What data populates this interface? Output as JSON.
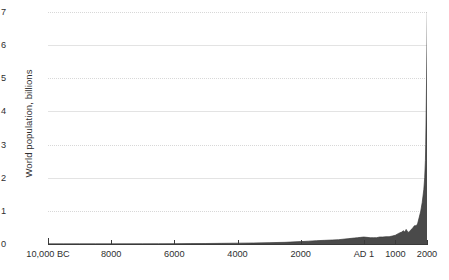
{
  "chart_data": {
    "type": "area",
    "title": "",
    "xlabel": "",
    "ylabel": "World population, billions",
    "ylim": [
      0,
      7
    ],
    "xlim": [
      -10000,
      2000
    ],
    "grid": true,
    "legend": "none",
    "fill_color": "#4a4a4a",
    "line_color": "#3a3a3a",
    "axis_color": "#3a3a3a",
    "gridline_color_solid": "#e3e3e3",
    "gridline_color_dotted": "#d8d8d8",
    "y_ticks": [
      {
        "value": 7,
        "label": "7"
      },
      {
        "value": 6,
        "label": "6"
      },
      {
        "value": 5,
        "label": "5"
      },
      {
        "value": 4,
        "label": "4"
      },
      {
        "value": 3,
        "label": "3"
      },
      {
        "value": 2,
        "label": "2"
      },
      {
        "value": 1,
        "label": "1"
      },
      {
        "value": 0,
        "label": "0"
      }
    ],
    "x_ticks": [
      {
        "value": -10000,
        "label": "10,000 BC"
      },
      {
        "value": -8000,
        "label": "8000"
      },
      {
        "value": -6000,
        "label": "6000"
      },
      {
        "value": -4000,
        "label": "4000"
      },
      {
        "value": -2000,
        "label": "2000"
      },
      {
        "value": 1,
        "label": "AD 1"
      },
      {
        "value": 1000,
        "label": "1000"
      },
      {
        "value": 2000,
        "label": "2000"
      }
    ],
    "x": [
      -10000,
      -9500,
      -9000,
      -8500,
      -8000,
      -7500,
      -7000,
      -6500,
      -6000,
      -5500,
      -5000,
      -4500,
      -4000,
      -3500,
      -3000,
      -2500,
      -2000,
      -1750,
      -1500,
      -1250,
      -1000,
      -800,
      -600,
      -500,
      -400,
      -300,
      -200,
      -100,
      1,
      100,
      200,
      300,
      400,
      500,
      600,
      700,
      800,
      900,
      1000,
      1100,
      1200,
      1250,
      1300,
      1340,
      1400,
      1450,
      1500,
      1550,
      1600,
      1650,
      1700,
      1750,
      1800,
      1850,
      1900,
      1927,
      1950,
      1960,
      1974,
      1987,
      1999,
      2011
    ],
    "y": [
      0.004,
      0.004,
      0.005,
      0.005,
      0.005,
      0.006,
      0.007,
      0.008,
      0.01,
      0.012,
      0.015,
      0.02,
      0.025,
      0.03,
      0.04,
      0.05,
      0.072,
      0.085,
      0.1,
      0.11,
      0.12,
      0.13,
      0.15,
      0.16,
      0.17,
      0.18,
      0.19,
      0.2,
      0.21,
      0.2,
      0.19,
      0.19,
      0.19,
      0.21,
      0.21,
      0.22,
      0.22,
      0.24,
      0.265,
      0.32,
      0.36,
      0.4,
      0.36,
      0.44,
      0.35,
      0.38,
      0.44,
      0.48,
      0.55,
      0.55,
      0.6,
      0.79,
      0.98,
      1.26,
      1.65,
      2.0,
      2.52,
      3.0,
      4.0,
      5.0,
      6.0,
      7.0
    ],
    "annotations": []
  }
}
